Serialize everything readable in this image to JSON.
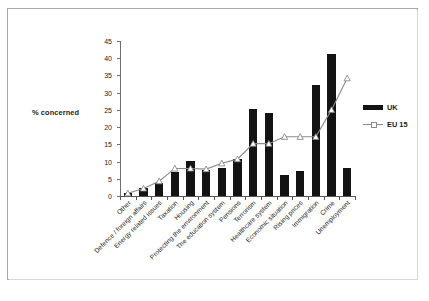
{
  "y_axis_title": "% concerned",
  "legend": {
    "items": [
      {
        "label": "UK",
        "marker": "bar-swatch",
        "color": "#131313"
      },
      {
        "label": "EU 15",
        "marker": "line-swatch",
        "color": "#8a8a8a"
      }
    ]
  },
  "chart_data": {
    "type": "bar",
    "title": "",
    "xlabel": "",
    "ylabel": "% concerned",
    "ylim": [
      0,
      45
    ],
    "yticks": [
      0,
      5,
      10,
      15,
      20,
      25,
      30,
      35,
      40,
      45
    ],
    "grid": false,
    "legend_position": "right",
    "categories": [
      "Other",
      "Defence / foreign affairs",
      "Energy related issues",
      "Taxation",
      "Housing",
      "Protecting the environment",
      "The education system",
      "Pensions",
      "Terrorism",
      "Healthcare system",
      "Economic situation",
      "Rising prices",
      "Immigration",
      "Crime",
      "Unemployment"
    ],
    "series": [
      {
        "name": "UK",
        "type": "bar",
        "color": "#131313",
        "values": [
          0.8,
          2.3,
          3.7,
          7.0,
          10.2,
          7.5,
          8.0,
          10.7,
          25.2,
          24.2,
          6.2,
          7.2,
          32.2,
          41.3,
          8.2
        ]
      },
      {
        "name": "EU 15",
        "type": "line",
        "color": "#8a8a8a",
        "marker": "triangle",
        "values": [
          0.8,
          2.2,
          4.3,
          8.0,
          8.0,
          7.8,
          9.5,
          10.7,
          15.2,
          15.2,
          17.2,
          17.2,
          17.2,
          25.0,
          34.2
        ]
      }
    ]
  }
}
